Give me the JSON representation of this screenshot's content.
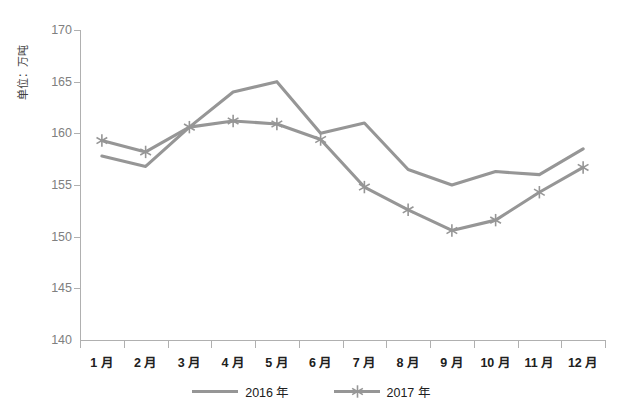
{
  "chart_data": {
    "type": "line",
    "title": "",
    "xlabel": "",
    "ylabel": "单位：万吨",
    "categories": [
      "1 月",
      "2 月",
      "3 月",
      "4 月",
      "5 月",
      "6 月",
      "7 月",
      "8 月",
      "9 月",
      "10 月",
      "11 月",
      "12 月"
    ],
    "series": [
      {
        "name": "2016 年",
        "color": "#969696",
        "marker": "none",
        "values": [
          157.8,
          156.8,
          160.6,
          164.0,
          165.0,
          160.0,
          161.0,
          156.5,
          155.0,
          156.3,
          156.0,
          158.5
        ]
      },
      {
        "name": "2017 年",
        "color": "#969696",
        "marker": "asterisk",
        "values": [
          159.3,
          158.2,
          160.6,
          161.2,
          160.9,
          159.4,
          154.8,
          152.6,
          150.6,
          151.6,
          154.3,
          156.7
        ]
      }
    ],
    "ylim": [
      140,
      170
    ],
    "yticks": [
      140,
      145,
      150,
      155,
      160,
      165,
      170
    ],
    "ytick_labels": [
      "140",
      "145",
      "150",
      "155",
      "160",
      "165",
      "170"
    ],
    "grid": false,
    "legend_position": "bottom"
  },
  "caption": {
    "text": ""
  }
}
